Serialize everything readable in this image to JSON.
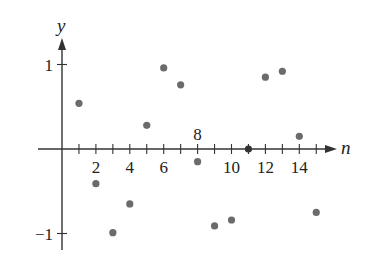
{
  "chart_data": {
    "type": "scatter",
    "title": "",
    "xlabel": "n",
    "ylabel": "y",
    "x": [
      1,
      2,
      3,
      4,
      5,
      6,
      7,
      8,
      9,
      10,
      11,
      12,
      13,
      14,
      15
    ],
    "series": [
      {
        "name": "a_n",
        "values": [
          0.84,
          -0.41,
          0.14,
          -0.76,
          -0.96,
          -0.28,
          0.66,
          0.99,
          0.41,
          -0.54,
          -1.0,
          -0.54,
          0.42,
          0.99,
          0.65
        ]
      }
    ],
    "plotted_points": [
      {
        "n": 1,
        "y": 0.54
      },
      {
        "n": 2,
        "y": -0.41
      },
      {
        "n": 3,
        "y": -0.99
      },
      {
        "n": 4,
        "y": -0.65
      },
      {
        "n": 5,
        "y": 0.28
      },
      {
        "n": 6,
        "y": 0.96
      },
      {
        "n": 7,
        "y": 0.76
      },
      {
        "n": 8,
        "y": -0.15
      },
      {
        "n": 9,
        "y": -0.91
      },
      {
        "n": 10,
        "y": -0.84
      },
      {
        "n": 11,
        "y": 0.0
      },
      {
        "n": 12,
        "y": 0.85
      },
      {
        "n": 13,
        "y": 0.92
      },
      {
        "n": 14,
        "y": 0.15
      },
      {
        "n": 15,
        "y": -0.75
      }
    ],
    "x_tick_labels": [
      {
        "value": 2,
        "label": "2",
        "position": "below"
      },
      {
        "value": 4,
        "label": "4",
        "position": "below"
      },
      {
        "value": 6,
        "label": "6",
        "position": "below"
      },
      {
        "value": 8,
        "label": "8",
        "position": "above"
      },
      {
        "value": 10,
        "label": "10",
        "position": "below"
      },
      {
        "value": 12,
        "label": "12",
        "position": "below"
      },
      {
        "value": 14,
        "label": "14",
        "position": "below"
      }
    ],
    "y_tick_labels": [
      {
        "value": 1,
        "label": "1"
      },
      {
        "value": -1,
        "label": "−1"
      }
    ],
    "xlim": [
      -1,
      16
    ],
    "ylim": [
      -1.2,
      1.3
    ],
    "grid": false,
    "legend": null,
    "colors": {
      "points": "#6b6b6b",
      "axes": "#333333"
    }
  }
}
